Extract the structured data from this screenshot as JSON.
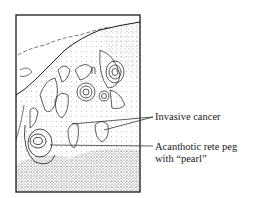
{
  "figure": {
    "labels": {
      "invasive_cancer": "Invasive cancer",
      "acanthotic_line1": "Acanthotic rete peg",
      "acanthotic_line2": "with “pearl”"
    },
    "colors": {
      "ink": "#1a1a1a",
      "paper": "#ffffff",
      "stipple": "#555555"
    }
  }
}
